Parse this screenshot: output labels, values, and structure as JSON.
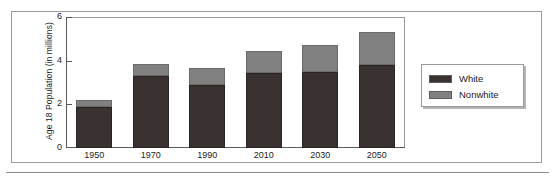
{
  "chart_data": {
    "type": "bar",
    "subtype": "stacked-vertical",
    "title": "",
    "xlabel": "",
    "ylabel": "Age 18 Population (in millions)",
    "categories": [
      "1950",
      "1970",
      "1990",
      "2010",
      "2030",
      "2050"
    ],
    "series": [
      {
        "name": "White",
        "color": "#3a3230",
        "values": [
          1.9,
          3.3,
          2.9,
          3.45,
          3.5,
          3.8
        ]
      },
      {
        "name": "Nonwhite",
        "color": "#818181",
        "values": [
          0.3,
          0.55,
          0.75,
          1.0,
          1.2,
          1.5
        ]
      }
    ],
    "totals": [
      2.2,
      3.85,
      3.65,
      4.45,
      4.7,
      5.3
    ],
    "ylim": [
      0,
      6
    ],
    "yticks": [
      0,
      2,
      4,
      6
    ],
    "ytick_labels": [
      "0",
      "2",
      "4",
      "6"
    ],
    "grid": false,
    "legend_position": "right-outside",
    "legend_entries": [
      "White",
      "Nonwhite"
    ]
  },
  "axis": {
    "y_title": "Age 18 Population (in millions)"
  },
  "legend": {
    "items": [
      {
        "label": "White"
      },
      {
        "label": "Nonwhite"
      }
    ]
  }
}
